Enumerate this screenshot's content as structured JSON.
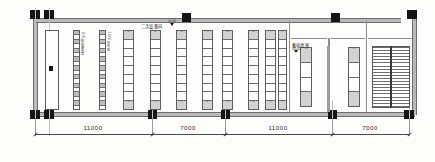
{
  "drawing": {
    "type": "architectural-floor-plan",
    "title_visible": false,
    "rooms": [
      {
        "id": "secondary-equipment-room",
        "label": "二次设备间",
        "level": "±0.00"
      },
      {
        "id": "battery-room",
        "label": "蓄电池室",
        "level": "±0.00"
      }
    ],
    "dimensions": {
      "unit": "mm",
      "bays": [
        "11000",
        "7000",
        "11000",
        "7000"
      ]
    },
    "equipment_columns": [
      {
        "id": "col-1",
        "style": "dense",
        "cells": 18,
        "tag_top": "",
        "tag_bottom": ""
      },
      {
        "id": "col-2",
        "style": "dense",
        "cells": 18,
        "tag_top": "",
        "tag_bottom": ""
      },
      {
        "id": "col-3",
        "style": "cabinet",
        "cells": 9,
        "tag_top": "57",
        "tag_bottom": "61"
      },
      {
        "id": "col-4",
        "style": "cabinet",
        "cells": 9,
        "tag_top": "50",
        "tag_bottom": "49"
      },
      {
        "id": "col-5",
        "style": "cabinet",
        "cells": 9,
        "tag_top": "48",
        "tag_bottom": "44"
      },
      {
        "id": "col-6",
        "style": "cabinet",
        "cells": 9,
        "tag_top": "40",
        "tag_bottom": "39"
      },
      {
        "id": "col-7",
        "style": "cabinet",
        "cells": 9,
        "tag_top": "35",
        "tag_bottom": "31"
      },
      {
        "id": "col-8",
        "style": "cabinet",
        "cells": 9,
        "tag_top": "24",
        "tag_bottom": "20"
      },
      {
        "id": "col-9",
        "style": "cabinet",
        "cells": 9,
        "tag_top": "9",
        "tag_bottom": "5"
      },
      {
        "id": "col-10",
        "style": "cabinet",
        "cells": 9,
        "tag_top": "3",
        "tag_bottom": "1"
      },
      {
        "id": "col-11",
        "style": "battery",
        "cells": 4,
        "tag_top": "16",
        "tag_bottom": ""
      },
      {
        "id": "col-12",
        "style": "battery",
        "cells": 4,
        "tag_top": "14",
        "tag_bottom": ""
      }
    ],
    "vertical_notes": [
      "GIS 配电装置室",
      "10kV 开关柜"
    ],
    "stair": {
      "id": "stairwell",
      "treads": 20
    },
    "left_room": {
      "id": "left-hall",
      "label": ""
    }
  }
}
